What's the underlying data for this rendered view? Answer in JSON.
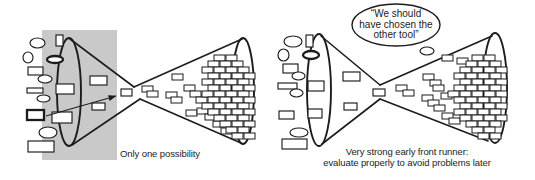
{
  "colors": {
    "background": "#ffffff",
    "line": "#1c1c1c",
    "fill": "#ffffff",
    "gray_panel": "#c9c9c9",
    "text": "#222222"
  },
  "left_diagram": {
    "caption": "Only one possibility",
    "gray_panel": {
      "x": 42,
      "y": 30,
      "w": 75,
      "h": 130
    },
    "funnel": {
      "left_ellipse": {
        "cx": 69,
        "cy": 92,
        "rx": 12,
        "ry": 54
      },
      "right_ellipse": {
        "cx": 243,
        "cy": 91,
        "rx": 11,
        "ry": 53
      },
      "lines": [
        [
          70,
          39,
          134,
          87
        ],
        [
          134,
          87,
          242,
          39
        ],
        [
          72,
          145,
          140,
          99
        ],
        [
          140,
          99,
          241,
          143
        ]
      ]
    },
    "arrow": {
      "x1": 46,
      "y1": 116,
      "x2": 116,
      "y2": 96
    },
    "brick_size": {
      "w": 11,
      "h": 6
    },
    "shapes": [
      {
        "t": "ellipse",
        "x": 30,
        "y": 38,
        "w": 15,
        "h": 10
      },
      {
        "t": "ellipse",
        "x": 23,
        "y": 52,
        "w": 10,
        "h": 11
      },
      {
        "t": "rect",
        "x": 28,
        "y": 67,
        "w": 15,
        "h": 8
      },
      {
        "t": "ellipse",
        "x": 38,
        "y": 75,
        "w": 14,
        "h": 8
      },
      {
        "t": "rect",
        "x": 27,
        "y": 88,
        "w": 16,
        "h": 5
      },
      {
        "t": "ellipse",
        "x": 37,
        "y": 95,
        "w": 13,
        "h": 7
      },
      {
        "t": "rect",
        "x": 27,
        "y": 110,
        "w": 17,
        "h": 10,
        "bold": true
      },
      {
        "t": "ellipse",
        "x": 39,
        "y": 127,
        "w": 18,
        "h": 11
      },
      {
        "t": "rect",
        "x": 28,
        "y": 141,
        "w": 26,
        "h": 11
      },
      {
        "t": "rect",
        "x": 56,
        "y": 35,
        "w": 7,
        "h": 11
      },
      {
        "t": "ellipse",
        "x": 47,
        "y": 56,
        "w": 16,
        "h": 7,
        "bold": true
      },
      {
        "t": "rect",
        "x": 56,
        "y": 84,
        "w": 18,
        "h": 10
      },
      {
        "t": "rect",
        "x": 90,
        "y": 76,
        "w": 17,
        "h": 9
      },
      {
        "t": "rect",
        "x": 52,
        "y": 112,
        "w": 20,
        "h": 11
      },
      {
        "t": "rect",
        "x": 92,
        "y": 103,
        "w": 13,
        "h": 7
      },
      {
        "t": "rect",
        "x": 121,
        "y": 89,
        "w": 11,
        "h": 7
      }
    ],
    "bricks": [
      [
        142,
        86
      ],
      [
        147,
        91
      ],
      [
        172,
        74
      ],
      [
        166,
        92
      ],
      [
        171,
        97
      ],
      [
        184,
        85
      ],
      [
        190,
        91
      ],
      [
        196,
        97
      ],
      [
        186,
        110
      ],
      [
        197,
        108
      ],
      [
        205,
        114
      ],
      [
        213,
        121
      ],
      [
        221,
        128
      ],
      [
        214,
        55
      ],
      [
        226,
        55
      ],
      [
        208,
        61
      ],
      [
        220,
        61
      ],
      [
        232,
        61
      ],
      [
        202,
        67
      ],
      [
        214,
        67
      ],
      [
        226,
        67
      ],
      [
        238,
        67
      ],
      [
        208,
        73
      ],
      [
        220,
        73
      ],
      [
        232,
        73
      ],
      [
        244,
        73
      ],
      [
        202,
        79
      ],
      [
        214,
        79
      ],
      [
        226,
        79
      ],
      [
        238,
        79
      ],
      [
        208,
        85
      ],
      [
        220,
        85
      ],
      [
        232,
        85
      ],
      [
        244,
        85
      ],
      [
        202,
        91
      ],
      [
        214,
        91
      ],
      [
        226,
        91
      ],
      [
        238,
        91
      ],
      [
        208,
        97
      ],
      [
        220,
        97
      ],
      [
        232,
        97
      ],
      [
        244,
        97
      ],
      [
        202,
        103
      ],
      [
        214,
        103
      ],
      [
        226,
        103
      ],
      [
        238,
        103
      ],
      [
        208,
        109
      ],
      [
        220,
        109
      ],
      [
        232,
        109
      ],
      [
        244,
        109
      ],
      [
        214,
        115
      ],
      [
        226,
        115
      ],
      [
        238,
        115
      ],
      [
        220,
        121
      ],
      [
        232,
        121
      ],
      [
        244,
        121
      ],
      [
        226,
        127
      ],
      [
        238,
        127
      ],
      [
        232,
        133
      ],
      [
        244,
        133
      ]
    ]
  },
  "right_diagram": {
    "caption_line1": "Very strong early front runner:",
    "caption_line2": "evaluate properly to avoid problems later",
    "bubble": {
      "cx": 396,
      "cy": 25,
      "rx": 44,
      "ry": 21,
      "tail": {
        "cx": 427,
        "cy": 51,
        "rx": 7,
        "ry": 4
      },
      "lines": [
        "“We should",
        "have chosen the",
        "other tool”"
      ]
    },
    "funnel": {
      "left_ellipse": {
        "cx": 319,
        "cy": 90,
        "rx": 12,
        "ry": 56
      },
      "right_ellipse": {
        "cx": 495,
        "cy": 88,
        "rx": 12,
        "ry": 55
      },
      "lines": [
        [
          321,
          36,
          380,
          85
        ],
        [
          380,
          85,
          492,
          36
        ],
        [
          322,
          144,
          380,
          99
        ],
        [
          380,
          99,
          488,
          141
        ]
      ]
    },
    "brick_size": {
      "w": 11,
      "h": 6
    },
    "shapes": [
      {
        "t": "ellipse",
        "x": 284,
        "y": 36,
        "w": 18,
        "h": 11
      },
      {
        "t": "rect",
        "x": 306,
        "y": 35,
        "w": 7,
        "h": 12
      },
      {
        "t": "ellipse",
        "x": 278,
        "y": 49,
        "w": 11,
        "h": 12
      },
      {
        "t": "ellipse",
        "x": 303,
        "y": 51,
        "w": 16,
        "h": 8,
        "bold": true
      },
      {
        "t": "rect",
        "x": 283,
        "y": 64,
        "w": 15,
        "h": 9
      },
      {
        "t": "ellipse",
        "x": 292,
        "y": 72,
        "w": 13,
        "h": 8
      },
      {
        "t": "rect",
        "x": 278,
        "y": 83,
        "w": 19,
        "h": 6
      },
      {
        "t": "ellipse",
        "x": 290,
        "y": 89,
        "w": 13,
        "h": 8
      },
      {
        "t": "rect",
        "x": 308,
        "y": 81,
        "w": 16,
        "h": 10
      },
      {
        "t": "rect",
        "x": 279,
        "y": 111,
        "w": 15,
        "h": 8
      },
      {
        "t": "rect",
        "x": 308,
        "y": 109,
        "w": 14,
        "h": 9
      },
      {
        "t": "ellipse",
        "x": 290,
        "y": 128,
        "w": 18,
        "h": 9
      },
      {
        "t": "rect",
        "x": 282,
        "y": 139,
        "w": 25,
        "h": 10
      },
      {
        "t": "rect",
        "x": 343,
        "y": 72,
        "w": 17,
        "h": 9
      },
      {
        "t": "rect",
        "x": 344,
        "y": 103,
        "w": 13,
        "h": 7
      },
      {
        "t": "rect",
        "x": 373,
        "y": 89,
        "w": 12,
        "h": 7
      }
    ],
    "bricks": [
      [
        396,
        85
      ],
      [
        403,
        90
      ],
      [
        423,
        74
      ],
      [
        430,
        80
      ],
      [
        433,
        85
      ],
      [
        422,
        95
      ],
      [
        428,
        100
      ],
      [
        434,
        105
      ],
      [
        441,
        93
      ],
      [
        442,
        113
      ],
      [
        449,
        118
      ],
      [
        442,
        55
      ],
      [
        457,
        58
      ],
      [
        472,
        55
      ],
      [
        484,
        55
      ],
      [
        466,
        61
      ],
      [
        478,
        61
      ],
      [
        490,
        61
      ],
      [
        460,
        67
      ],
      [
        472,
        67
      ],
      [
        484,
        67
      ],
      [
        496,
        67
      ],
      [
        454,
        73
      ],
      [
        466,
        73
      ],
      [
        478,
        73
      ],
      [
        490,
        73
      ],
      [
        460,
        79
      ],
      [
        472,
        79
      ],
      [
        484,
        79
      ],
      [
        496,
        79
      ],
      [
        454,
        85
      ],
      [
        466,
        85
      ],
      [
        478,
        85
      ],
      [
        490,
        85
      ],
      [
        448,
        91
      ],
      [
        460,
        91
      ],
      [
        472,
        91
      ],
      [
        484,
        91
      ],
      [
        496,
        91
      ],
      [
        454,
        97
      ],
      [
        466,
        97
      ],
      [
        478,
        97
      ],
      [
        490,
        97
      ],
      [
        460,
        103
      ],
      [
        472,
        103
      ],
      [
        484,
        103
      ],
      [
        496,
        103
      ],
      [
        454,
        109
      ],
      [
        466,
        109
      ],
      [
        478,
        109
      ],
      [
        490,
        109
      ],
      [
        460,
        115
      ],
      [
        472,
        115
      ],
      [
        484,
        115
      ],
      [
        496,
        115
      ],
      [
        466,
        121
      ],
      [
        478,
        121
      ],
      [
        490,
        121
      ],
      [
        472,
        127
      ],
      [
        484,
        127
      ],
      [
        478,
        133
      ],
      [
        490,
        133
      ]
    ]
  }
}
